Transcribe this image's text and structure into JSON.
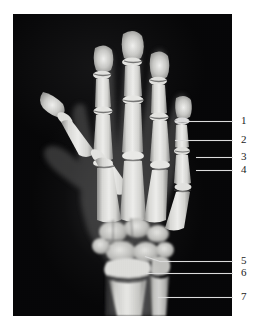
{
  "figure": {
    "kind": "radiograph-figure",
    "modality_label": "x-ray",
    "background_color": "#ffffff",
    "plate_color": "#050506",
    "leader_line_color": "#dcdcdc",
    "label_color": "#1b1b1b",
    "panel": {
      "left": 13,
      "top": 14,
      "width": 219,
      "height": 302
    }
  },
  "xray": {
    "view": "hand-posteroanterior",
    "subject": "left hand and distal forearm",
    "visible_structures": [
      "distal phalanges",
      "middle phalanges",
      "proximal phalanges",
      "metacarpals",
      "carpal bones",
      "distal radius",
      "distal ulna",
      "epiphyseal growth plates"
    ]
  },
  "annotations": [
    {
      "id": "1",
      "number": "1",
      "label_x": 241,
      "label_y": 115,
      "line_x1": 175,
      "line_x2": 233,
      "line_y": 121
    },
    {
      "id": "2",
      "number": "2",
      "label_x": 241,
      "label_y": 134,
      "line_x1": 175,
      "line_x2": 233,
      "line_y": 140
    },
    {
      "id": "3",
      "number": "3",
      "label_x": 241,
      "label_y": 151,
      "line_x1": 196,
      "line_x2": 233,
      "line_y": 157
    },
    {
      "id": "4",
      "number": "4",
      "label_x": 241,
      "label_y": 164,
      "line_x1": 196,
      "line_x2": 233,
      "line_y": 170
    },
    {
      "id": "5",
      "number": "5",
      "label_x": 241,
      "label_y": 255,
      "line_x1": 152,
      "line_x2": 233,
      "line_y": 261
    },
    {
      "id": "6",
      "number": "6",
      "label_x": 241,
      "label_y": 267,
      "line_x1": 146,
      "line_x2": 233,
      "line_y": 273
    },
    {
      "id": "7",
      "number": "7",
      "label_x": 241,
      "label_y": 291,
      "line_x1": 158,
      "line_x2": 233,
      "line_y": 297
    }
  ]
}
